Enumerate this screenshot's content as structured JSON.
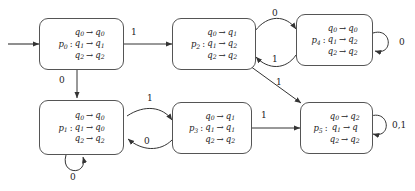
{
  "diagram": {
    "alphabet": [
      "0",
      "1"
    ],
    "start_state": "p0",
    "arrow_glyph": "→",
    "states": [
      {
        "id": "p0",
        "name": "p",
        "sub": "0",
        "maps": [
          {
            "from": "q",
            "from_sub": "0",
            "to": "q",
            "to_sub": "0"
          },
          {
            "from": "q",
            "from_sub": "1",
            "to": "q",
            "to_sub": "1"
          },
          {
            "from": "q",
            "from_sub": "2",
            "to": "q",
            "to_sub": "2"
          }
        ]
      },
      {
        "id": "p2",
        "name": "p",
        "sub": "2",
        "maps": [
          {
            "from": "q",
            "from_sub": "0",
            "to": "q",
            "to_sub": "1"
          },
          {
            "from": "q",
            "from_sub": "1",
            "to": "q",
            "to_sub": "2"
          },
          {
            "from": "q",
            "from_sub": "2",
            "to": "q",
            "to_sub": "2"
          }
        ]
      },
      {
        "id": "p4",
        "name": "p",
        "sub": "4",
        "maps": [
          {
            "from": "q",
            "from_sub": "0",
            "to": "q",
            "to_sub": "0"
          },
          {
            "from": "q",
            "from_sub": "1",
            "to": "q",
            "to_sub": "2"
          },
          {
            "from": "q",
            "from_sub": "2",
            "to": "q",
            "to_sub": "2"
          }
        ]
      },
      {
        "id": "p1",
        "name": "p",
        "sub": "1",
        "maps": [
          {
            "from": "q",
            "from_sub": "0",
            "to": "q",
            "to_sub": "0"
          },
          {
            "from": "q",
            "from_sub": "1",
            "to": "q",
            "to_sub": "0"
          },
          {
            "from": "q",
            "from_sub": "2",
            "to": "q",
            "to_sub": "2"
          }
        ]
      },
      {
        "id": "p3",
        "name": "p",
        "sub": "3",
        "maps": [
          {
            "from": "q",
            "from_sub": "0",
            "to": "q",
            "to_sub": "1"
          },
          {
            "from": "q",
            "from_sub": "1",
            "to": "q",
            "to_sub": "1"
          },
          {
            "from": "q",
            "from_sub": "2",
            "to": "q",
            "to_sub": "2"
          }
        ]
      },
      {
        "id": "p5",
        "name": "p",
        "sub": "5",
        "maps": [
          {
            "from": "q",
            "from_sub": "0",
            "to": "q",
            "to_sub": "2"
          },
          {
            "from": "q",
            "from_sub": "1",
            "to": "q",
            "to_sub": ""
          },
          {
            "from": "q",
            "from_sub": "2",
            "to": "q",
            "to_sub": "2"
          }
        ]
      }
    ],
    "transitions": [
      {
        "id": "t-p0-p2",
        "from": "p0",
        "to": "p2",
        "label": "1"
      },
      {
        "id": "t-p0-p1",
        "from": "p0",
        "to": "p1",
        "label": "0"
      },
      {
        "id": "t-p2-p4",
        "from": "p2",
        "to": "p4",
        "label": "0"
      },
      {
        "id": "t-p4-p2",
        "from": "p4",
        "to": "p2",
        "label": "1"
      },
      {
        "id": "t-p4-p4",
        "from": "p4",
        "to": "p4",
        "label": "0"
      },
      {
        "id": "t-p2-p5",
        "from": "p2",
        "to": "p5",
        "label": "1"
      },
      {
        "id": "t-p1-p3",
        "from": "p1",
        "to": "p3",
        "label": "1"
      },
      {
        "id": "t-p3-p1",
        "from": "p3",
        "to": "p1",
        "label": "0"
      },
      {
        "id": "t-p1-p1",
        "from": "p1",
        "to": "p1",
        "label": "0"
      },
      {
        "id": "t-p3-p5",
        "from": "p3",
        "to": "p5",
        "label": "1"
      },
      {
        "id": "t-p5-p5",
        "from": "p5",
        "to": "p5",
        "label": "0,1"
      }
    ],
    "colors": {
      "stroke": "#555555",
      "text": "#222222",
      "background": "#ffffff"
    }
  }
}
